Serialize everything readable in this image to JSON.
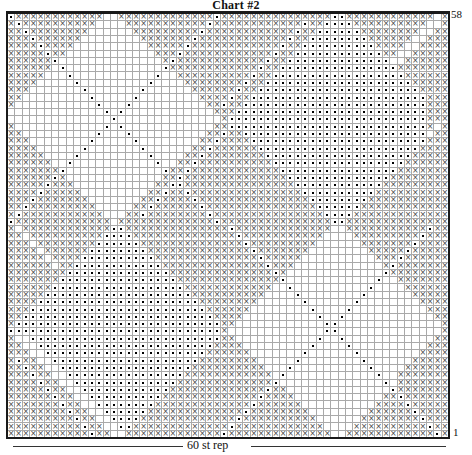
{
  "page": {
    "background": "#ffffff"
  },
  "chart_data": {
    "type": "heatmap",
    "title": "Chart #2",
    "grid": {
      "columns": 60,
      "rows": 58
    },
    "row_label_top": "58",
    "row_label_bottom": "1",
    "x_axis_label": "60 st rep",
    "legend_position": "none",
    "grid_on": true,
    "symbols": {
      "x": "×",
      "o": "small-black-square-dot",
      ".": "blank"
    },
    "colors": {
      "x_symbol": "#474747",
      "dot_symbol": "#000000",
      "grid_line": "#a9a9a9",
      "border": "#1a1a1a",
      "background": "#ffffff"
    },
    "rows": [
      "oxxxxxxxxxxxx..xxxxxxxxxxxxxoxxxxxxxxxxxxxxxooxxxxxxxxxxxx.x",
      "xoxxxxxxxxxx....xxxxxxxxxxxoxxxxxxxxxxxxoxxooooxxxxxxxxxx..x",
      "xxoxxxxxxxx......xxxxxxxxxoxxxxxxxxxxxxoxxooooooxxxxxxxx..xx",
      "xxxoxxxxxx........xxxxxxxoxxxxxxxxxxxxoxxooooooooxxxxxx..xxx",
      "xxxxoxxxx..........xxxxxoxxxxxxxxxxxxoxxooooooooooxxxx..xxxx",
      "xxxxxoxx............xxxoxxxxxxxxxxxxoxxooooooooooooxx..xxxxx",
      "xxxxxxo..............xoxxxxxxxxxxxxoxxoooooooooooooo..xxxxxx",
      "xxxxxx.o.............oxxxxxxxxxxxxoxxooooooooooooooooxxxxxxx",
      "xxxxx...o...........o..xxxxxxxxxxoxxooooooooooooooooooxxxxxx",
      "xxxx.....o.........o....xxxxxxxxoxxooooooooooooooooooooxxxxx",
      "xxx.......o.......o......xxxxxxoxxooooooooooooooooooooooxxxx",
      "xx.........o.....o........xxxxoxxooooooooooooooooooooooooxxx",
      "x...........o...o..........xxoxxoooooooooooooooooooooooooxxx",
      ".............o.o............xxxooooooooooooooooooooooooooxxx",
      "..............o..............xoooooooooooooooooooooooooooxxx",
      "x............o.o............xxooooooooooooooooooooooooooox.x",
      "xx..........o...o..........xxoxxooooooooooooooooooooooooo.xx",
      "xxx........o.....o........xxoxxxxooooooooooooooooooooooooxxx",
      "xxxx......o.......o......xxoxxxxxxooooooooooooooooooooooxxxx",
      "xxxxx....o.........o....xxoxxxxxxxxooooooooooooooooooooxxxxx",
      "xxxxxx..o...........o..xxoxxxxxxxxxxooooooooooooooooooxxxxxx",
      "xxxxxxxo.............oxxoxxxxxxxxxxxxooooooooooooooooxxxxxxx",
      "xxxxxxox.............xxoxxxxxxxxxxxxxxooooooooooooooxxxxxxxx",
      "xxxxxoxxx...........xxooxxxxxxxxxxxxxxxooooooooooooxxxxxxxxx",
      "xxxxoxxxxx.........xxoxxoxxxxxxxxxxxxxxxooooooooooxxxxxxxxxx",
      "xxxoxxxxxxx.......xxoxxxxoxxxxxxxxxxxxxxxooooooooxxxxxxxxxxx",
      "xxoxxxxxxxxx.....xxoxxxxxxoxxxxxxxxxxxxxxxooooooxxxxxxxxxxxx",
      "xoxxxxxxxxxxx...xxoxxxxxxxxoxxxxxxxxxxxxxxxooooxxxxxxxxxxxxx",
      "oxxxxxxxxxxxxx.xxxxxxxxxxxxxoxxxxxxxxxxxxxxxooxxxxxxxxxxxxxx",
      "x.xxxxxxxxxxxxooxxxxxxxxxxxxxxoxxxxxxxxxxxxx..xxxxxxxxxxxoxx",
      "xx.xxxxxxxxxxooooxxxxxxxxxxxxxxoxxxxxxxxxxx....xxxxxxxxxoxxx",
      "xxx.xxxxxxxxooooooxxxxxxxxxxxxxxoxxxxxxxxx......xxxxxxxoxxxx",
      "xxxx.xxxxxxooooooooxxxxxxxxxxxxxxoxxxxxxx........xxxxxoxxxxx",
      "xxxxx.xxxxooooooooooxxxxxxxxxxxxxxoxxxxx..........xxxoxxxxxx",
      "xxxxxx.xxooooooooooooxxxxxxxxxxxxxxoxxx............xoxxxxxxx",
      "xxxxxxxxooooooooooooooxxxxxxxxxxxxxxox.............oxxxxxxxx",
      "xxxxxxxooooooooooooooooxxxxxxxxxxxxxxo............o..xxxxxxx",
      "xxxxxxooooooooooooooooooxxxxxxxxxxxx..o..........o....xxxxxx",
      "xxxxxooooooooooooooooooooxxxxxxxxxx....o........o......xxxxx",
      "xxxxooooooooooooooooooooooxxxxxxxx......o......o........xxxx",
      "xxxooooooooooooooooooooooooxxxxxx........o....o..........xxx",
      "xxooooooooooooooooooooooooooxxxx..........o..o............xx",
      "xooooooooooooooooooooooooooooxx............oo..............x",
      "ooooooooooooooooooooooooooooox.............oo..............x",
      "x..ooooooooooooooooooooooooooxx...........o..o............xx",
      "xx..ooooooooooooooooooooooooxxxx.........o....o..........xxx",
      "xxx..ooooooooooooooooooooooxxxxxx.......o......o........xxxx",
      "xoxx..ooooooooooooooooooooxxxxxxxx.....o........o......xxxxx",
      "xxoxx..ooooooooooooooooooxxxxxxxxxx...o..........o....xxxxxx",
      "xxxoxx..ooooooooooooooooxxxxxxxxxxxx.o............o..xxxxxxx",
      "xxxxoxx..ooooooooooooooxxxxxxxxxxxxxo..............o.xxxxxxx",
      "xxxxxoxx..ooooooooooooxxxxxxxxxxxxxoxx..............oxxxxxxx",
      "xxxxxxoxx..ooooooooooxxxxxxxxxxxxxoxxxx............xxoxxxxxx",
      "xxxxxxxoxx..ooooooooxxxxxxxxxxxxxoxxxxxx..........xxxxoxxxxx",
      "xxxxxxxxoxx..ooooooxxxxxxxxxxxxxoxxxxxxxx........xxxxxxoxxxx",
      "xxxxxxxxxoxx..ooooxxxxxxxxxxxxxoxxxxxxxxxx......xxxxxxxxoxxx",
      "xxxxxxxxxxoxx..ooxxxxxxxxxxxxxoxxxxxxxxxxxx....xxxxxxxxxxoxx",
      "xxxxxxxxxxxoxx..xxxxxxxxxxxxxoxxxxxxxxxxxxxx..xxxxxxxxxxxxox"
    ]
  }
}
